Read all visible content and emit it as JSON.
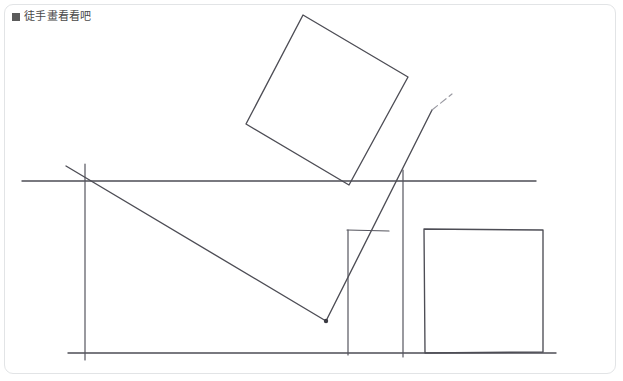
{
  "window": {
    "title": "徒手畫看看吧",
    "bullet_icon": "filled-square-bullet",
    "border_color": "#e2e4e6",
    "background_color": "#ffffff"
  },
  "header": {
    "label": "徒手畫看看吧"
  },
  "drawing": {
    "ink_color": "#4d4d55",
    "faint_ink_color": "#9a9aa2",
    "shapes": [
      {
        "name": "rotated-square",
        "type": "polygon",
        "points": "303,15 408,77 349,185 246,124"
      },
      {
        "name": "horizon-line",
        "type": "line",
        "points": "22,181 536,181"
      },
      {
        "name": "ground-line",
        "type": "line",
        "points": "68,353 556,353"
      },
      {
        "name": "left-vertical-line",
        "type": "line",
        "points": "85,164 85,360"
      },
      {
        "name": "long-diagonal-line",
        "type": "line",
        "points": "66,166 326,321"
      },
      {
        "name": "rising-diagonal-line",
        "type": "line",
        "points": "326,321 432,110"
      },
      {
        "name": "rising-diagonal-faint-extension",
        "type": "line",
        "points": "432,110 452,94"
      },
      {
        "name": "center-vertical-line",
        "type": "line",
        "points": "348,230 348,355"
      },
      {
        "name": "center-top-cap-line",
        "type": "line",
        "points": "347,230 389,231"
      },
      {
        "name": "right-vertical-line",
        "type": "line",
        "points": "403,170 403,357"
      },
      {
        "name": "right-rectangle",
        "type": "polygon",
        "points": "424,229 543,230 543,352 425,353"
      }
    ],
    "vertex_marker": {
      "name": "diagonal-junction-vertex",
      "x": 326,
      "y": 321,
      "radius": 2.2
    }
  }
}
